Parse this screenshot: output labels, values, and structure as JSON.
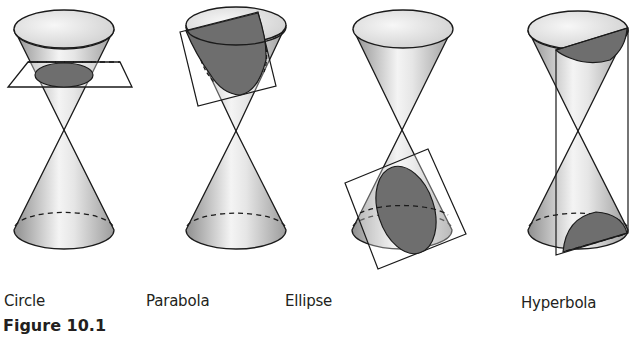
{
  "figure": {
    "caption": "Figure 10.1",
    "panels": [
      {
        "id": "circle",
        "label": "Circle"
      },
      {
        "id": "parabola",
        "label": "Parabola"
      },
      {
        "id": "ellipse",
        "label": "Ellipse"
      },
      {
        "id": "hyperbola",
        "label": "Hyperbola"
      }
    ]
  },
  "colors": {
    "stroke": "#1a1a1a",
    "section_fill": "#6e6e6e",
    "cone_light": "#f2f2f2",
    "cone_dark": "#9a9a9a",
    "text": "#231f20"
  }
}
